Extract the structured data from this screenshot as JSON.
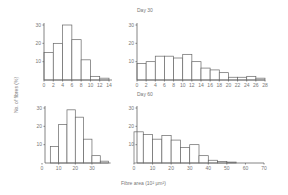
{
  "figure": {
    "ylabel": "No. of fibres (%)",
    "xlabel": "Fibre area (10² μm²)"
  },
  "chart_data": [
    {
      "type": "bar",
      "title": "",
      "xlabel": "Fibre area (10² μm²)",
      "ylabel": "No. of fibres (%)",
      "bin_width": 2,
      "categories": [
        "0-2",
        "2-4",
        "4-6",
        "6-8",
        "8-10",
        "10-12",
        "12-14"
      ],
      "values": [
        15,
        20,
        30,
        22,
        11,
        2,
        1
      ],
      "x_ticks": [
        0,
        2,
        4,
        6,
        8,
        10,
        12,
        14
      ],
      "y_ticks": [
        10,
        20,
        30
      ],
      "xlim": [
        0,
        14
      ],
      "ylim": [
        0,
        30
      ]
    },
    {
      "type": "bar",
      "title": "Day 30",
      "xlabel": "Fibre area (10² μm²)",
      "ylabel": "No. of fibres (%)",
      "bin_width": 2,
      "categories": [
        "0-2",
        "2-4",
        "4-6",
        "6-8",
        "8-10",
        "10-12",
        "12-14",
        "14-16",
        "16-18",
        "18-20",
        "20-22",
        "22-24",
        "24-26",
        "26-28"
      ],
      "values": [
        9,
        10,
        13,
        13,
        12,
        14,
        10,
        6.5,
        5.5,
        4,
        1.5,
        1.5,
        2,
        1
      ],
      "x_ticks": [
        0,
        2,
        4,
        6,
        8,
        10,
        12,
        14,
        16,
        18,
        20,
        22,
        24,
        26,
        28
      ],
      "y_ticks": [
        10,
        20,
        30
      ],
      "xlim": [
        0,
        28
      ],
      "ylim": [
        0,
        30
      ]
    },
    {
      "type": "bar",
      "title": "",
      "xlabel": "Fibre area (10² μm²)",
      "ylabel": "No. of fibres (%)",
      "bin_width": 5,
      "categories": [
        "5-10",
        "10-15",
        "15-20",
        "20-25",
        "25-30",
        "30-35",
        "35-40"
      ],
      "values": [
        9,
        21,
        29,
        25,
        13,
        4,
        1
      ],
      "x_ticks": [
        0,
        10,
        20,
        30
      ],
      "y_ticks": [
        10,
        20,
        30
      ],
      "xlim": [
        0,
        40
      ],
      "ylim": [
        0,
        30
      ]
    },
    {
      "type": "bar",
      "title": "Day 60",
      "xlabel": "Fibre area (10² μm²)",
      "ylabel": "No. of fibres (%)",
      "bin_width": 5,
      "categories": [
        "0-5",
        "5-10",
        "10-15",
        "15-20",
        "20-25",
        "25-30",
        "30-35",
        "35-40",
        "40-45",
        "45-50",
        "50-55"
      ],
      "values": [
        17,
        15.5,
        13,
        15,
        12.5,
        8.5,
        10,
        4,
        1.5,
        0.8,
        0.5
      ],
      "x_ticks": [
        0,
        10,
        20,
        30,
        40,
        50,
        60,
        70
      ],
      "y_ticks": [
        10,
        20,
        30
      ],
      "xlim": [
        0,
        70
      ],
      "ylim": [
        0,
        30
      ]
    }
  ]
}
